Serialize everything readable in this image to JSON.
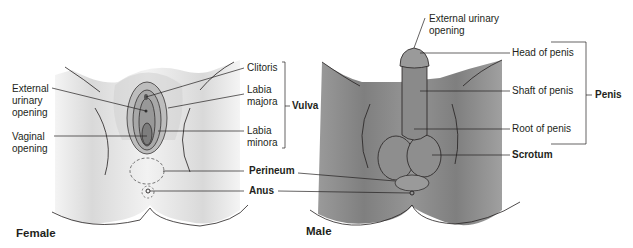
{
  "female": {
    "title": "Female",
    "labels": {
      "external_urinary_opening": "External\nurinary\nopening",
      "vaginal_opening": "Vaginal\nopening",
      "clitoris": "Clitoris",
      "labia_majora": "Labia\nmajora",
      "labia_minora": "Labia\nminora",
      "vulva": "Vulva"
    }
  },
  "shared": {
    "perineum": "Perineum",
    "anus": "Anus"
  },
  "male": {
    "title": "Male",
    "labels": {
      "external_urinary_opening": "External urinary\nopening",
      "head_of_penis": "Head of penis",
      "shaft_of_penis": "Shaft of penis",
      "root_of_penis": "Root of penis",
      "penis": "Penis",
      "scrotum": "Scrotum"
    }
  },
  "colors": {
    "female_skin": "#e4e4e4",
    "male_skin": "#8a8a8a",
    "line": "#231f20"
  }
}
